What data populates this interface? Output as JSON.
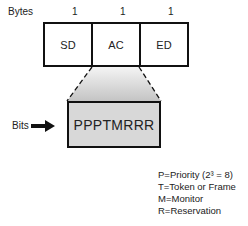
{
  "frame": {
    "bytes_label": "Bytes",
    "fields": [
      {
        "name": "SD",
        "bytes": "1"
      },
      {
        "name": "AC",
        "bytes": "1"
      },
      {
        "name": "ED",
        "bytes": "1"
      }
    ]
  },
  "access_control": {
    "bits_label": "Bits",
    "bits_value": "PPPTMRRR",
    "arrow_icon": "arrow-right-icon"
  },
  "legend": {
    "items": [
      {
        "text": "P=Priority (2³ = 8)"
      },
      {
        "text": "T=Token or Frame"
      },
      {
        "text": "M=Monitor"
      },
      {
        "text": "R=Reservation"
      }
    ]
  },
  "colors": {
    "outline": "#111111",
    "bits_fill": "#d8d8d8",
    "gradient_top": "#f2f2f2",
    "gradient_bottom": "#c8c8c8"
  }
}
